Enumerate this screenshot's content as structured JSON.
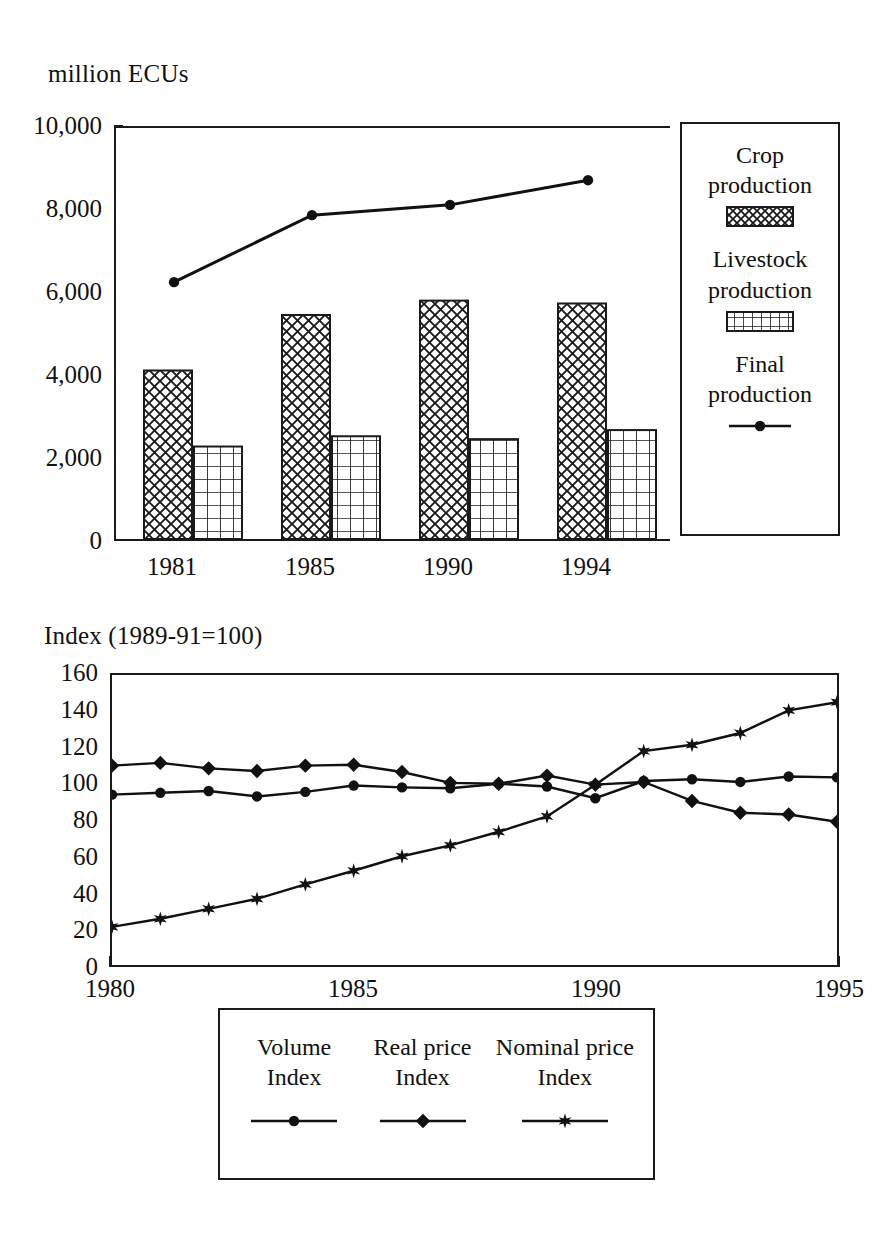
{
  "page": {
    "width": 883,
    "height": 1243,
    "background": "#ffffff",
    "ink": "#111111"
  },
  "chart_data": [
    {
      "id": "production-bar-chart",
      "type": "bar",
      "title": "",
      "ylabel": "million ECUs",
      "xlabel": "",
      "categories": [
        "1981",
        "1985",
        "1990",
        "1994"
      ],
      "ylim": [
        0,
        10000
      ],
      "yticks": [
        0,
        2000,
        4000,
        6000,
        8000,
        10000
      ],
      "ytick_labels": [
        "0",
        "2,000",
        "4,000",
        "6,000",
        "8,000",
        "10,000"
      ],
      "grid": false,
      "legend_position": "right",
      "series": [
        {
          "name": "Crop production",
          "kind": "bar",
          "pattern": "diagonal-crosshatch",
          "values": [
            4100,
            5450,
            5800,
            5730
          ]
        },
        {
          "name": "Livestock production",
          "kind": "bar",
          "pattern": "square-grid",
          "values": [
            2250,
            2500,
            2430,
            2650
          ]
        },
        {
          "name": "Final production",
          "kind": "line",
          "marker": "circle",
          "values": [
            6250,
            7880,
            8130,
            8730
          ]
        }
      ]
    },
    {
      "id": "index-line-chart",
      "type": "line",
      "title": "",
      "ylabel": "Index (1989-91=100)",
      "xlabel": "",
      "ylim": [
        0,
        160
      ],
      "yticks": [
        0,
        20,
        40,
        60,
        80,
        100,
        120,
        140,
        160
      ],
      "ytick_labels": [
        "0",
        "20",
        "40",
        "60",
        "80",
        "100",
        "120",
        "140",
        "160"
      ],
      "xlim": [
        1980,
        1995
      ],
      "x": [
        1980,
        1981,
        1982,
        1983,
        1984,
        1985,
        1986,
        1987,
        1988,
        1989,
        1990,
        1991,
        1992,
        1993,
        1994,
        1995
      ],
      "xticks_major": [
        1980,
        1985,
        1990,
        1995
      ],
      "xtick_labels": [
        "1980",
        "1985",
        "1990",
        "1995"
      ],
      "grid": false,
      "legend_position": "bottom",
      "series": [
        {
          "name": "Volume Index",
          "marker": "circle",
          "values": [
            94,
            95,
            96,
            93,
            95.5,
            99,
            98,
            97.5,
            100,
            98.5,
            92,
            101.5,
            102.5,
            101,
            104,
            103.5
          ]
        },
        {
          "name": "Real price Index",
          "marker": "diamond",
          "values": [
            110,
            111.5,
            108.5,
            107,
            110,
            110.5,
            106.5,
            100.5,
            100,
            104.5,
            99.5,
            101,
            90.5,
            84,
            83,
            79
          ]
        },
        {
          "name": "Nominal price Index",
          "marker": "star",
          "values": [
            21,
            25.5,
            31,
            36.5,
            44.5,
            52,
            60,
            66,
            73.5,
            82,
            99.5,
            118,
            121.5,
            128,
            140.5,
            145
          ]
        }
      ]
    }
  ],
  "bar_legend": {
    "entries": [
      {
        "label_line1": "Crop",
        "label_line2": "production",
        "swatch": "crosshatch-swatch"
      },
      {
        "label_line1": "Livestock",
        "label_line2": "production",
        "swatch": "grid-swatch"
      },
      {
        "label_line1": "Final",
        "label_line2": "production",
        "swatch": "line-marker-swatch"
      }
    ]
  },
  "line_legend": {
    "entries": [
      {
        "label_line1": "Volume",
        "label_line2": "Index",
        "swatch": "line-circle-swatch"
      },
      {
        "label_line1": "Real price",
        "label_line2": "Index",
        "swatch": "line-diamond-swatch"
      },
      {
        "label_line1": "Nominal price",
        "label_line2": "Index",
        "swatch": "line-star-swatch"
      }
    ]
  },
  "labels": {
    "bar_chart_unit": "million ECUs",
    "line_chart_unit": "Index (1989-91=100)"
  }
}
